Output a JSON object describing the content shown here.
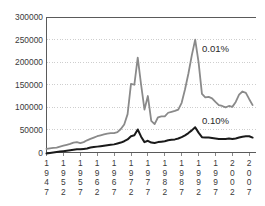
{
  "chart_data": {
    "type": "line",
    "title": "",
    "subtitle": "",
    "xlabel": "",
    "ylabel": "",
    "grid": true,
    "legend_position": "inline-annotation",
    "ylim": [
      0,
      300000
    ],
    "ytick_labels": [
      "300000",
      "250000",
      "200000",
      "150000",
      "100000",
      "50000",
      "0"
    ],
    "ytick_values": [
      300000,
      250000,
      200000,
      150000,
      100000,
      50000,
      0
    ],
    "xtick_labels": [
      "1947",
      "1952",
      "1957",
      "1962",
      "1967",
      "1972",
      "1977",
      "1982",
      "1987",
      "1992",
      "1997",
      "2002",
      "2007"
    ],
    "xlim": [
      1947,
      2009
    ],
    "annotations": [
      {
        "text": "0.01%",
        "x": 1993,
        "y": 222000
      },
      {
        "text": "0.10%",
        "x": 1993,
        "y": 63000
      }
    ],
    "series": [
      {
        "name": "0.01%",
        "color": "#8a8a8a",
        "width": 1.8,
        "x": [
          1947,
          1948,
          1949,
          1950,
          1951,
          1952,
          1953,
          1954,
          1955,
          1956,
          1957,
          1958,
          1959,
          1960,
          1961,
          1962,
          1963,
          1964,
          1965,
          1966,
          1967,
          1968,
          1969,
          1970,
          1971,
          1972,
          1973,
          1974,
          1975,
          1976,
          1977,
          1978,
          1979,
          1980,
          1981,
          1982,
          1983,
          1984,
          1985,
          1986,
          1987,
          1988,
          1989,
          1990,
          1991,
          1992,
          1993,
          1994,
          1995,
          1996,
          1997,
          1998,
          1999,
          2000,
          2001,
          2002,
          2003,
          2004,
          2005,
          2006,
          2007,
          2008
        ],
        "values": [
          8000,
          9000,
          10000,
          11000,
          13000,
          15000,
          17000,
          19000,
          22000,
          23000,
          21000,
          23000,
          27000,
          30000,
          33000,
          36000,
          38000,
          40000,
          42000,
          43000,
          43000,
          45000,
          52000,
          62000,
          85000,
          152000,
          150000,
          210000,
          150000,
          95000,
          125000,
          70000,
          63000,
          78000,
          80000,
          80000,
          88000,
          90000,
          92000,
          95000,
          110000,
          140000,
          175000,
          215000,
          250000,
          200000,
          130000,
          122000,
          123000,
          120000,
          112000,
          105000,
          103000,
          100000,
          103000,
          101000,
          112000,
          128000,
          135000,
          132000,
          118000,
          105000
        ]
      },
      {
        "name": "0.10%",
        "color": "#1a1a1a",
        "width": 2.0,
        "x": [
          1947,
          1948,
          1949,
          1950,
          1951,
          1952,
          1953,
          1954,
          1955,
          1956,
          1957,
          1958,
          1959,
          1960,
          1961,
          1962,
          1963,
          1964,
          1965,
          1966,
          1967,
          1968,
          1969,
          1970,
          1971,
          1972,
          1973,
          1974,
          1975,
          1976,
          1977,
          1978,
          1979,
          1980,
          1981,
          1982,
          1983,
          1984,
          1985,
          1986,
          1987,
          1988,
          1989,
          1990,
          1991,
          1992,
          1993,
          1994,
          1995,
          1996,
          1997,
          1998,
          1999,
          2000,
          2001,
          2002,
          2003,
          2004,
          2005,
          2006,
          2007,
          2008
        ],
        "values": [
          -2000,
          -1000,
          0,
          1000,
          2000,
          3000,
          4000,
          5000,
          6000,
          7000,
          7000,
          8000,
          9000,
          11000,
          12000,
          13000,
          14000,
          15000,
          16000,
          17000,
          18000,
          20000,
          22000,
          25000,
          29000,
          36000,
          38000,
          51000,
          35000,
          23000,
          26000,
          22000,
          21000,
          23000,
          24000,
          25000,
          27000,
          28000,
          29000,
          31000,
          34000,
          38000,
          43000,
          49000,
          56000,
          44000,
          34000,
          33000,
          33000,
          32000,
          31000,
          30000,
          30000,
          30000,
          31000,
          30000,
          31000,
          33000,
          35000,
          36000,
          36000,
          33000
        ]
      }
    ]
  },
  "frame": {
    "background_color": "#ffffff",
    "axis_color": "#5a5a5a",
    "grid_color": "#b9b9b9"
  }
}
